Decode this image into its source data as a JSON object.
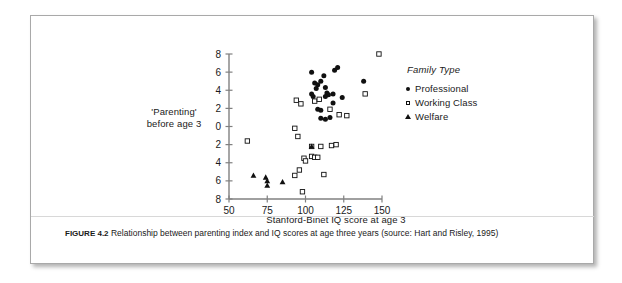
{
  "figure": {
    "caption_label": "FIGURE 4.2",
    "caption_text": "Relationship between parenting index and IQ scores at age three years (source: Hart and Risley, 1995)"
  },
  "legend": {
    "title": "Family Type",
    "entries": [
      {
        "label": "Professional",
        "marker": "filled-circle-icon",
        "color": "#101010"
      },
      {
        "label": "Working Class",
        "marker": "open-square-icon",
        "color": "#101010"
      },
      {
        "label": "Welfare",
        "marker": "filled-triangle-icon",
        "color": "#101010"
      }
    ]
  },
  "chart_data": {
    "type": "scatter",
    "title": "",
    "xlabel": "Stanford-Binet IQ score at age 3",
    "ylabel_lines": [
      "'Parenting'",
      "before age 3"
    ],
    "ylabel": "'Parenting' before age 3",
    "xlim": [
      50,
      150
    ],
    "ylim": [
      -8,
      8
    ],
    "xticks": [
      50,
      75,
      100,
      125,
      150
    ],
    "xtick_labels": [
      "50",
      "75",
      "100",
      "125",
      "150"
    ],
    "yticks": [
      8,
      6,
      4,
      2,
      0,
      -2,
      -4,
      -6,
      -8
    ],
    "ytick_labels": [
      "8",
      "6",
      "4",
      "2",
      "0",
      "2",
      "4",
      "6",
      "8"
    ],
    "grid": false,
    "legend_position": "right",
    "axis_color": "#808080",
    "series": [
      {
        "name": "Professional",
        "marker": "filled-circle",
        "color": "#101010",
        "points": [
          [
            104,
            6.0
          ],
          [
            106,
            4.8
          ],
          [
            108,
            4.6
          ],
          [
            107,
            4.2
          ],
          [
            104,
            3.6
          ],
          [
            105,
            3.3
          ],
          [
            110,
            5.0
          ],
          [
            112,
            5.6
          ],
          [
            113,
            4.3
          ],
          [
            114,
            3.7
          ],
          [
            115,
            3.5
          ],
          [
            113,
            3.3
          ],
          [
            108,
            1.9
          ],
          [
            110,
            1.8
          ],
          [
            119,
            6.2
          ],
          [
            121,
            6.5
          ],
          [
            118,
            3.6
          ],
          [
            124,
            3.2
          ],
          [
            118,
            2.6
          ],
          [
            138,
            5.0
          ],
          [
            110,
            0.9
          ],
          [
            113,
            0.8
          ],
          [
            116,
            1.0
          ]
        ]
      },
      {
        "name": "Working Class",
        "marker": "open-square",
        "color": "#101010",
        "points": [
          [
            148,
            8.0
          ],
          [
            94,
            2.9
          ],
          [
            97,
            2.5
          ],
          [
            106,
            2.8
          ],
          [
            109,
            3.0
          ],
          [
            116,
            1.9
          ],
          [
            122,
            1.3
          ],
          [
            127,
            1.2
          ],
          [
            139,
            3.6
          ],
          [
            93,
            -0.2
          ],
          [
            95,
            -1.1
          ],
          [
            62,
            -1.6
          ],
          [
            104,
            -2.2
          ],
          [
            110,
            -2.2
          ],
          [
            117,
            -2.1
          ],
          [
            99,
            -3.5
          ],
          [
            100,
            -3.8
          ],
          [
            104,
            -3.3
          ],
          [
            106,
            -3.4
          ],
          [
            108,
            -3.4
          ],
          [
            96,
            -4.8
          ],
          [
            93,
            -5.4
          ],
          [
            112,
            -5.3
          ],
          [
            98,
            -7.2
          ],
          [
            120,
            -2.0
          ]
        ]
      },
      {
        "name": "Welfare",
        "marker": "filled-triangle",
        "color": "#101010",
        "points": [
          [
            66,
            -5.4
          ],
          [
            74,
            -5.6
          ],
          [
            75,
            -6.0
          ],
          [
            75,
            -6.5
          ],
          [
            85,
            -6.1
          ],
          [
            104,
            -2.2
          ]
        ]
      }
    ]
  }
}
